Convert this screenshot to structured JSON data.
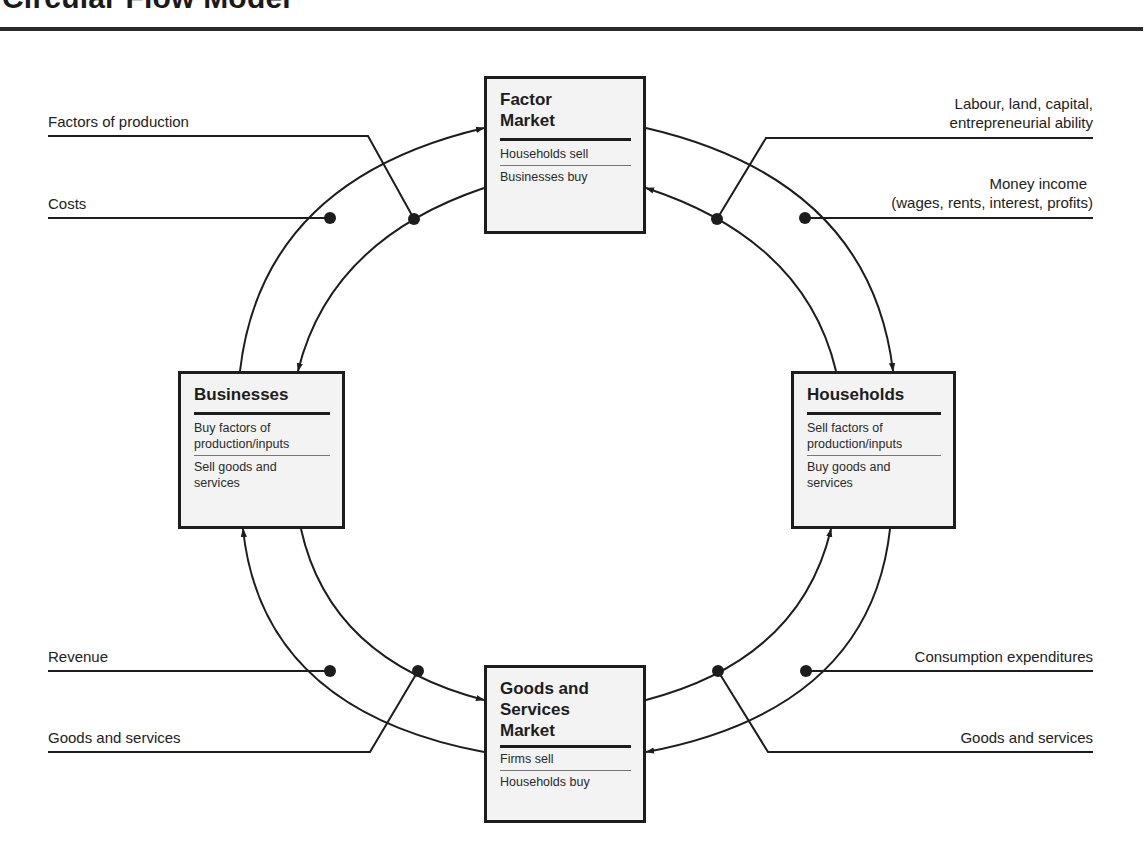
{
  "header": {
    "title": "Circular Flow Model"
  },
  "colors": {
    "ink": "#1d1d1d",
    "box_fill": "#f3f3f3",
    "background": "#ffffff"
  },
  "nodes": {
    "factor_market": {
      "title_line1": "Factor",
      "title_line2": "Market",
      "row1": "Households sell",
      "row2": "Businesses buy"
    },
    "businesses": {
      "title": "Businesses",
      "row1_line1": "Buy factors of",
      "row1_line2": "production/inputs",
      "row2_line1": "Sell goods and",
      "row2_line2": "services"
    },
    "households": {
      "title": "Households",
      "row1_line1": "Sell factors of",
      "row1_line2": "production/inputs",
      "row2_line1": "Buy goods and",
      "row2_line2": "services"
    },
    "goods_market": {
      "title_line1": "Goods and",
      "title_line2": "Services",
      "title_line3": "Market",
      "row1": "Firms sell",
      "row2": "Households buy"
    }
  },
  "flow_labels": {
    "top_left_outer": "Factors of production",
    "top_left_inner": "Costs",
    "top_right_outer_line1": "Labour, land, capital,",
    "top_right_outer_line2": "entrepreneurial ability",
    "top_right_inner_line1": "Money income",
    "top_right_inner_line2": "(wages, rents, interest, profits)",
    "bottom_left_inner": "Revenue",
    "bottom_left_outer": "Goods and services",
    "bottom_right_inner": "Consumption expenditures",
    "bottom_right_outer": "Goods and services"
  },
  "flows": [
    {
      "from": "Businesses",
      "to": "Factor Market",
      "label": "Costs",
      "kind": "money"
    },
    {
      "from": "Factor Market",
      "to": "Businesses",
      "label": "Factors of production",
      "kind": "real"
    },
    {
      "from": "Factor Market",
      "to": "Households",
      "label": "Money income (wages, rents, interest, profits)",
      "kind": "money"
    },
    {
      "from": "Households",
      "to": "Factor Market",
      "label": "Labour, land, capital, entrepreneurial ability",
      "kind": "real"
    },
    {
      "from": "Goods and Services Market",
      "to": "Businesses",
      "label": "Revenue",
      "kind": "money"
    },
    {
      "from": "Businesses",
      "to": "Goods and Services Market",
      "label": "Goods and services",
      "kind": "real"
    },
    {
      "from": "Households",
      "to": "Goods and Services Market",
      "label": "Consumption expenditures",
      "kind": "money"
    },
    {
      "from": "Goods and Services Market",
      "to": "Households",
      "label": "Goods and services",
      "kind": "real"
    }
  ]
}
